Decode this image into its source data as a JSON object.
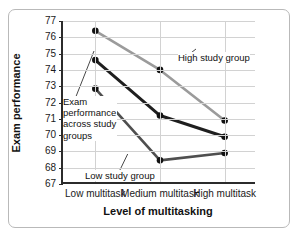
{
  "chart_data": {
    "type": "line",
    "title": "",
    "xlabel": "Level of multitasking",
    "ylabel": "Exam performance",
    "categories": [
      "Low multitask",
      "Medium multitask",
      "High multitask"
    ],
    "ylim": [
      67,
      77
    ],
    "yticks": [
      67,
      68,
      69,
      70,
      71,
      72,
      73,
      74,
      75,
      76,
      77
    ],
    "grid": true,
    "legend_position": "inline-annotations",
    "series": [
      {
        "name": "High study group",
        "values": [
          76.4,
          74.0,
          70.9
        ],
        "color": "#9b9b9b"
      },
      {
        "name": "Medium study group",
        "values": [
          74.6,
          71.2,
          69.9
        ],
        "color": "#1f1f1f"
      },
      {
        "name": "Low study group",
        "values": [
          72.85,
          68.45,
          68.9
        ],
        "color": "#4f4f4f"
      }
    ],
    "annotations": [
      {
        "id": "high",
        "text": "High study group"
      },
      {
        "id": "exam",
        "text": "Exam performance across study groups"
      },
      {
        "id": "low",
        "text": "Low study group"
      }
    ]
  },
  "annotations": {
    "high_study_group": "High study group",
    "low_study_group": "Low study group",
    "exam_across_groups_l1": "Exam",
    "exam_across_groups_l2": "performance",
    "exam_across_groups_l3": "across study",
    "exam_across_groups_l4": "groups"
  }
}
